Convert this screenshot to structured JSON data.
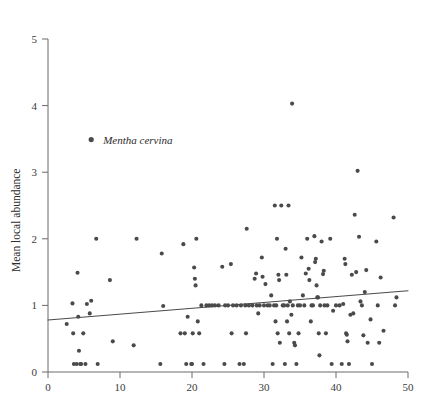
{
  "chart_data": {
    "type": "scatter",
    "title": "",
    "subtitle": "",
    "xlabel": "",
    "ylabel": "Mean local abundance",
    "xlim": [
      0,
      50
    ],
    "ylim": [
      0,
      5
    ],
    "xticks": [
      0,
      10,
      20,
      30,
      40,
      50
    ],
    "yticks": [
      0,
      1,
      2,
      3,
      4,
      5
    ],
    "xtick_labels": [
      "0",
      "10",
      "20",
      "30",
      "40",
      "50"
    ],
    "ytick_labels": [
      "0",
      "1",
      "2",
      "3",
      "4",
      "5"
    ],
    "grid": false,
    "legend_position": "upper-left-inside",
    "marker_color": "#4a4a4a",
    "marker_size": 4.1,
    "line_color": "#4a4a4a",
    "axis_color": "#6b6b6b",
    "background_color": "#ffffff",
    "series": [
      {
        "name": "Mentha cervina",
        "marker": "filled-circle",
        "points": [
          [
            2.6,
            0.72
          ],
          [
            3.4,
            1.03
          ],
          [
            3.5,
            0.58
          ],
          [
            3.6,
            0.12
          ],
          [
            4.0,
            0.12
          ],
          [
            4.1,
            1.49
          ],
          [
            4.2,
            0.83
          ],
          [
            4.3,
            0.32
          ],
          [
            4.5,
            0.12
          ],
          [
            4.6,
            0.12
          ],
          [
            4.9,
            0.58
          ],
          [
            5.2,
            0.12
          ],
          [
            5.4,
            1.02
          ],
          [
            5.8,
            0.88
          ],
          [
            6.0,
            1.07
          ],
          [
            6.7,
            2.0
          ],
          [
            6.9,
            0.12
          ],
          [
            8.6,
            1.38
          ],
          [
            9.0,
            0.46
          ],
          [
            11.9,
            0.4
          ],
          [
            12.3,
            2.0
          ],
          [
            15.6,
            0.12
          ],
          [
            15.8,
            1.78
          ],
          [
            16.0,
            0.99
          ],
          [
            18.4,
            0.58
          ],
          [
            18.8,
            1.92
          ],
          [
            19.0,
            0.58
          ],
          [
            19.2,
            0.12
          ],
          [
            19.4,
            0.83
          ],
          [
            19.9,
            0.12
          ],
          [
            20.0,
            0.12
          ],
          [
            20.1,
            0.58
          ],
          [
            20.3,
            1.57
          ],
          [
            20.4,
            1.4
          ],
          [
            20.5,
            1.3
          ],
          [
            20.6,
            2.0
          ],
          [
            20.8,
            0.76
          ],
          [
            21.0,
            0.58
          ],
          [
            21.3,
            1.0
          ],
          [
            21.6,
            0.12
          ],
          [
            22.0,
            1.0
          ],
          [
            22.4,
            1.0
          ],
          [
            22.8,
            1.0
          ],
          [
            23.2,
            1.0
          ],
          [
            23.7,
            1.0
          ],
          [
            24.2,
            1.58
          ],
          [
            24.5,
            0.12
          ],
          [
            24.6,
            1.0
          ],
          [
            25.0,
            1.0
          ],
          [
            25.4,
            1.62
          ],
          [
            25.5,
            0.58
          ],
          [
            25.7,
            1.0
          ],
          [
            26.2,
            1.0
          ],
          [
            26.6,
            0.12
          ],
          [
            26.8,
            1.0
          ],
          [
            27.2,
            0.12
          ],
          [
            27.4,
            1.0
          ],
          [
            27.5,
            0.58
          ],
          [
            27.6,
            2.15
          ],
          [
            27.9,
            1.0
          ],
          [
            28.4,
            1.0
          ],
          [
            28.7,
            1.4
          ],
          [
            28.9,
            1.48
          ],
          [
            29.0,
            1.0
          ],
          [
            29.2,
            0.88
          ],
          [
            29.4,
            1.0
          ],
          [
            29.7,
            1.72
          ],
          [
            29.8,
            1.43
          ],
          [
            30.0,
            1.0
          ],
          [
            30.2,
            1.32
          ],
          [
            30.5,
            1.0
          ],
          [
            30.8,
            1.0
          ],
          [
            31.0,
            1.15
          ],
          [
            31.2,
            0.12
          ],
          [
            31.4,
            1.0
          ],
          [
            31.5,
            2.5
          ],
          [
            31.6,
            0.76
          ],
          [
            31.7,
            1.0
          ],
          [
            31.8,
            2.0
          ],
          [
            31.9,
            0.58
          ],
          [
            32.0,
            1.46
          ],
          [
            32.1,
            1.38
          ],
          [
            32.2,
            0.44
          ],
          [
            32.4,
            2.5
          ],
          [
            32.6,
            1.0
          ],
          [
            32.8,
            1.0
          ],
          [
            32.9,
            0.12
          ],
          [
            33.0,
            1.85
          ],
          [
            33.1,
            1.46
          ],
          [
            33.2,
            0.76
          ],
          [
            33.3,
            1.0
          ],
          [
            33.4,
            2.5
          ],
          [
            33.5,
            0.58
          ],
          [
            33.6,
            1.06
          ],
          [
            33.8,
            0.86
          ],
          [
            33.9,
            4.03
          ],
          [
            34.0,
            1.0
          ],
          [
            34.2,
            0.44
          ],
          [
            34.3,
            0.4
          ],
          [
            34.5,
            0.12
          ],
          [
            34.7,
            1.0
          ],
          [
            34.8,
            0.58
          ],
          [
            35.0,
            1.0
          ],
          [
            35.2,
            1.72
          ],
          [
            35.4,
            1.15
          ],
          [
            35.6,
            1.0
          ],
          [
            35.8,
            1.48
          ],
          [
            36.0,
            2.0
          ],
          [
            36.2,
            1.55
          ],
          [
            36.3,
            1.38
          ],
          [
            36.5,
            0.76
          ],
          [
            36.6,
            1.0
          ],
          [
            36.8,
            1.0
          ],
          [
            37.0,
            2.04
          ],
          [
            37.1,
            1.65
          ],
          [
            37.2,
            1.7
          ],
          [
            37.3,
            1.3
          ],
          [
            37.4,
            1.12
          ],
          [
            37.5,
            1.12
          ],
          [
            37.6,
            0.58
          ],
          [
            37.7,
            0.25
          ],
          [
            37.8,
            1.0
          ],
          [
            38.0,
            1.96
          ],
          [
            38.2,
            1.47
          ],
          [
            38.3,
            1.52
          ],
          [
            38.4,
            1.0
          ],
          [
            38.6,
            0.58
          ],
          [
            38.8,
            1.0
          ],
          [
            39.2,
            2.0
          ],
          [
            39.4,
            0.12
          ],
          [
            39.6,
            0.92
          ],
          [
            40.0,
            1.0
          ],
          [
            40.5,
            1.0
          ],
          [
            40.8,
            0.12
          ],
          [
            41.0,
            1.02
          ],
          [
            41.2,
            1.7
          ],
          [
            41.3,
            1.62
          ],
          [
            41.4,
            0.58
          ],
          [
            41.5,
            0.56
          ],
          [
            41.6,
            0.46
          ],
          [
            41.8,
            0.12
          ],
          [
            42.0,
            0.86
          ],
          [
            42.2,
            1.46
          ],
          [
            42.4,
            0.88
          ],
          [
            42.6,
            2.36
          ],
          [
            42.8,
            1.5
          ],
          [
            43.0,
            3.02
          ],
          [
            43.2,
            2.03
          ],
          [
            43.4,
            1.06
          ],
          [
            43.6,
            1.0
          ],
          [
            43.8,
            0.55
          ],
          [
            44.0,
            1.2
          ],
          [
            44.2,
            1.53
          ],
          [
            44.4,
            0.44
          ],
          [
            44.8,
            0.79
          ],
          [
            45.0,
            0.12
          ],
          [
            45.6,
            1.96
          ],
          [
            45.8,
            1.0
          ],
          [
            46.0,
            0.44
          ],
          [
            46.2,
            1.42
          ],
          [
            46.6,
            0.62
          ],
          [
            48.0,
            2.32
          ],
          [
            48.2,
            1.0
          ],
          [
            48.4,
            1.12
          ]
        ]
      }
    ],
    "trendline": {
      "name": "linear fit",
      "x_start": 0,
      "y_start": 0.78,
      "x_end": 50,
      "y_end": 1.22,
      "color": "#4a4a4a",
      "width": 1.1
    },
    "legend": [
      {
        "label": "Mentha cervina",
        "marker": "filled-circle",
        "color": "#4a4a4a",
        "x": 6.0,
        "y": 3.49
      }
    ]
  }
}
